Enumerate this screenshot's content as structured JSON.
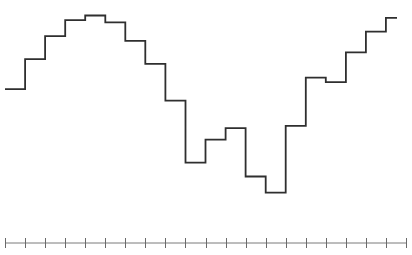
{
  "chart_data": {
    "type": "line",
    "subtype": "step",
    "title": "",
    "xlabel": "",
    "ylabel": "",
    "grid": false,
    "legend": null,
    "x_ticks": [
      0,
      1,
      2,
      3,
      4,
      5,
      6,
      7,
      8,
      9,
      10,
      11,
      12,
      13,
      14,
      15,
      16,
      17,
      18,
      19,
      20
    ],
    "x_tick_labels": [],
    "x": [
      0,
      1,
      2,
      3,
      4,
      5,
      6,
      7,
      8,
      9,
      10,
      11,
      12,
      13,
      14,
      15,
      16,
      17,
      18,
      19
    ],
    "values": [
      63,
      76,
      86,
      93,
      95,
      92,
      84,
      74,
      58,
      31,
      41,
      46,
      25,
      18,
      47,
      68,
      66,
      79,
      88,
      94
    ],
    "ylim": [
      0,
      100
    ],
    "series_color": "#2f2f2f",
    "axis_color": "#7a7a7a"
  },
  "layout": {
    "plot_left": 5,
    "plot_right": 406,
    "axis_y": 243,
    "tick_half_height": 5,
    "y_top_px": 4,
    "y_bottom_px": 234,
    "step_width_px": 20.05,
    "last_step_end_x": 397
  }
}
